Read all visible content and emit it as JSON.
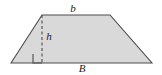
{
  "figure": {
    "type": "trapezoid-with-height",
    "canvas": {
      "width": 162,
      "height": 75
    },
    "background_color": "#ffffff",
    "fill_color": "#d9d9d9",
    "stroke_color": "#4d4d4d",
    "label_color": "#1a1a1a",
    "stroke_width": 1.1,
    "vertices": {
      "bottom_left": {
        "x": 11,
        "y": 63
      },
      "top_left": {
        "x": 42,
        "y": 15
      },
      "top_right": {
        "x": 110,
        "y": 15
      },
      "bottom_right": {
        "x": 152,
        "y": 63
      }
    },
    "height_line": {
      "name": "dashed-height-segment",
      "x": 42,
      "y_top": 15,
      "y_bottom": 63,
      "dash_pattern": "3,2.5"
    },
    "right_angle_marker": {
      "name": "right-angle-square",
      "x": 33,
      "y": 54,
      "size": 9
    },
    "labels": {
      "top_base": "b",
      "height": "h",
      "bottom_base": "B"
    }
  }
}
